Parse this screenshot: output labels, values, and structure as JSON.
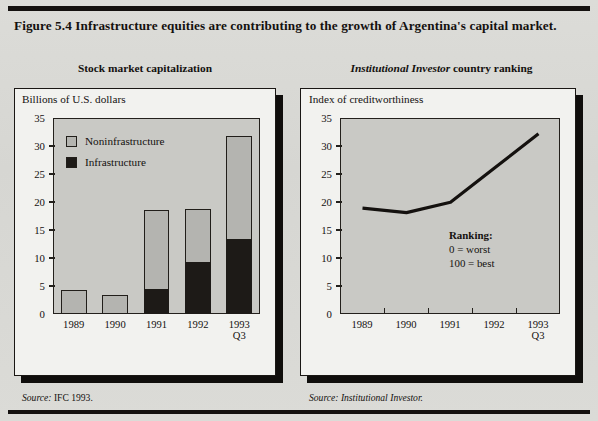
{
  "figure": {
    "title": "Figure 5.4  Infrastructure equities are contributing to the growth of Argentina's capital market."
  },
  "left_panel": {
    "title_plain": "Stock market capitalization",
    "axis_caption": "Billions of U.S. dollars",
    "source_label": "Source:",
    "source_text": " IFC 1993.",
    "legend": [
      {
        "label": "Noninfrastructure",
        "color": "#b4b4b0"
      },
      {
        "label": "Infrastructure",
        "color": "#1d1a17"
      }
    ]
  },
  "right_panel": {
    "title_italic": "Institutional Investor",
    "title_rest": " country ranking",
    "axis_caption": "Index of creditworthiness",
    "source_label": "Source:",
    "source_text": " Institutional Investor.",
    "annotation": {
      "heading": "Ranking:",
      "line1": "0 = worst",
      "line2": "100 = best"
    }
  },
  "chart_data": [
    {
      "type": "bar",
      "title": "Stock market capitalization",
      "xlabel": "",
      "ylabel": "Billions of U.S. dollars",
      "ylim": [
        0,
        35
      ],
      "yticks": [
        0,
        5,
        10,
        15,
        20,
        25,
        30,
        35
      ],
      "grid": false,
      "stacked": true,
      "legend_position": "upper-left",
      "categories": [
        "1989",
        "1990",
        "1991",
        "1992",
        "1993 Q3"
      ],
      "category_sublabels": [
        "",
        "",
        "",
        "",
        "Q3"
      ],
      "series": [
        {
          "name": "Infrastructure",
          "color": "#1d1a17",
          "values": [
            0,
            0,
            4.4,
            9.2,
            13.4
          ]
        },
        {
          "name": "Noninfrastructure",
          "color": "#b4b4b0",
          "values": [
            4.3,
            3.4,
            14.2,
            9.5,
            18.4
          ]
        }
      ],
      "totals": [
        4.3,
        3.4,
        18.6,
        18.7,
        31.8
      ]
    },
    {
      "type": "line",
      "title": "Institutional Investor country ranking",
      "xlabel": "",
      "ylabel": "Index of creditworthiness",
      "ylim": [
        0,
        35
      ],
      "yticks": [
        0,
        5,
        10,
        15,
        20,
        25,
        30,
        35
      ],
      "grid": false,
      "x": [
        "1989",
        "1990",
        "1991",
        "1992",
        "1993 Q3"
      ],
      "series": [
        {
          "name": "Index of creditworthiness",
          "color": "#14110f",
          "values": [
            19.0,
            18.2,
            20.1,
            26.3,
            32.5
          ]
        }
      ],
      "annotation": "Ranking: 0 = worst, 100 = best"
    }
  ]
}
